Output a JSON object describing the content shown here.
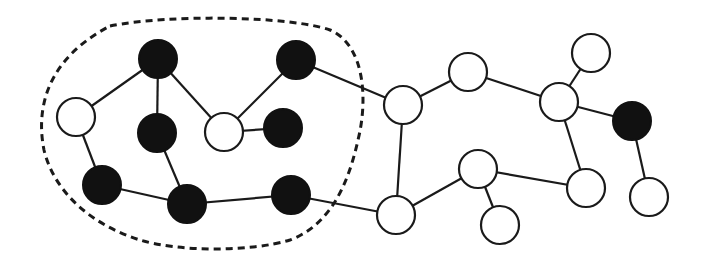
{
  "diagram": {
    "type": "graph",
    "colors": {
      "filled": "#111111",
      "empty": "#ffffff",
      "stroke": "#1a1a1a",
      "background": "#ffffff"
    },
    "node_radius": 19,
    "nodes": [
      {
        "id": "A",
        "x": 76,
        "y": 117,
        "fill": "white"
      },
      {
        "id": "B",
        "x": 158,
        "y": 59,
        "fill": "black"
      },
      {
        "id": "C",
        "x": 157,
        "y": 133,
        "fill": "black"
      },
      {
        "id": "D",
        "x": 224,
        "y": 132,
        "fill": "white"
      },
      {
        "id": "E",
        "x": 296,
        "y": 60,
        "fill": "black"
      },
      {
        "id": "F",
        "x": 283,
        "y": 128,
        "fill": "black"
      },
      {
        "id": "G",
        "x": 102,
        "y": 185,
        "fill": "black"
      },
      {
        "id": "H",
        "x": 187,
        "y": 204,
        "fill": "black"
      },
      {
        "id": "I",
        "x": 291,
        "y": 195,
        "fill": "black"
      },
      {
        "id": "J",
        "x": 403,
        "y": 105,
        "fill": "white"
      },
      {
        "id": "K",
        "x": 468,
        "y": 72,
        "fill": "white"
      },
      {
        "id": "L",
        "x": 591,
        "y": 53,
        "fill": "white"
      },
      {
        "id": "M",
        "x": 559,
        "y": 102,
        "fill": "white"
      },
      {
        "id": "N",
        "x": 632,
        "y": 121,
        "fill": "black"
      },
      {
        "id": "O",
        "x": 478,
        "y": 169,
        "fill": "white"
      },
      {
        "id": "P",
        "x": 586,
        "y": 188,
        "fill": "white"
      },
      {
        "id": "Q",
        "x": 649,
        "y": 197,
        "fill": "white"
      },
      {
        "id": "R",
        "x": 396,
        "y": 215,
        "fill": "white"
      },
      {
        "id": "S",
        "x": 500,
        "y": 225,
        "fill": "white"
      }
    ],
    "edges": [
      [
        "A",
        "B"
      ],
      [
        "B",
        "C"
      ],
      [
        "B",
        "D"
      ],
      [
        "D",
        "E"
      ],
      [
        "D",
        "F"
      ],
      [
        "A",
        "G"
      ],
      [
        "C",
        "H"
      ],
      [
        "G",
        "H"
      ],
      [
        "H",
        "I"
      ],
      [
        "E",
        "J"
      ],
      [
        "I",
        "R"
      ],
      [
        "J",
        "R"
      ],
      [
        "J",
        "K"
      ],
      [
        "K",
        "M"
      ],
      [
        "M",
        "L"
      ],
      [
        "M",
        "N"
      ],
      [
        "M",
        "P"
      ],
      [
        "N",
        "Q"
      ],
      [
        "R",
        "O"
      ],
      [
        "O",
        "P"
      ],
      [
        "O",
        "S"
      ]
    ],
    "boundary": {
      "style": "dashed",
      "encloses": [
        "A",
        "B",
        "C",
        "D",
        "E",
        "F",
        "G",
        "H",
        "I"
      ],
      "extent": {
        "left": 40,
        "top": 20,
        "right": 362,
        "bottom": 250
      }
    }
  }
}
